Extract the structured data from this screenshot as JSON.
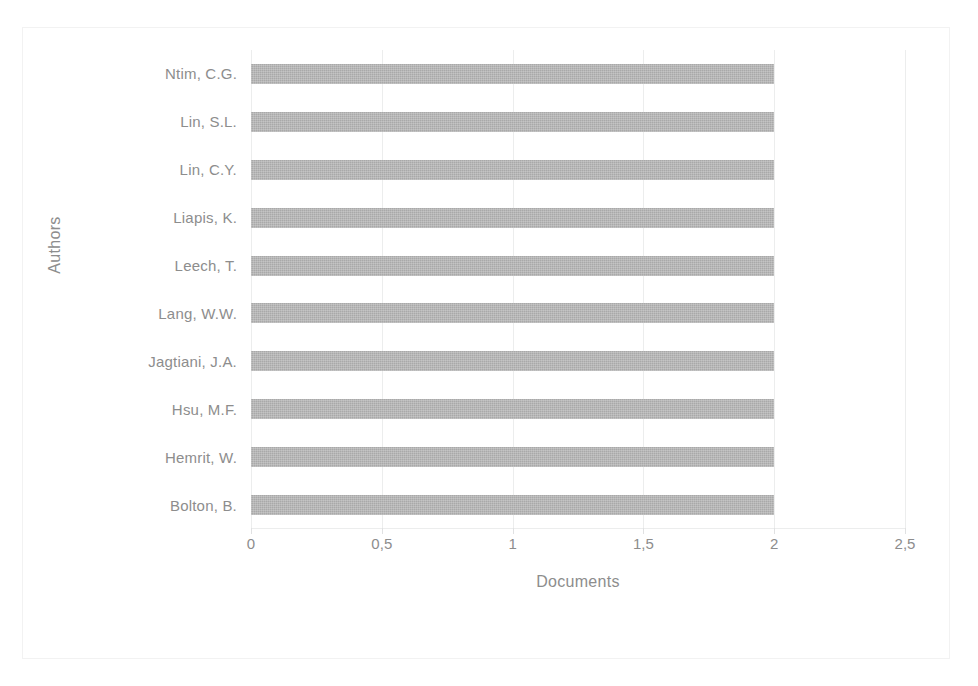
{
  "chart_data": {
    "type": "bar",
    "orientation": "horizontal",
    "title": "",
    "xlabel": "Documents",
    "ylabel": "Authors",
    "categories": [
      "Ntim, C.G.",
      "Lin, S.L.",
      "Lin, C.Y.",
      "Liapis, K.",
      "Leech, T.",
      "Lang, W.W.",
      "Jagtiani, J.A.",
      "Hsu, M.F.",
      "Hemrit, W.",
      "Bolton, B."
    ],
    "values": [
      2,
      2,
      2,
      2,
      2,
      2,
      2,
      2,
      2,
      2
    ],
    "xlim": [
      0,
      2.5
    ],
    "xticks": [
      0,
      0.5,
      1,
      1.5,
      2,
      2.5
    ],
    "xtick_labels": [
      "0",
      "0,5",
      "1",
      "1,5",
      "2",
      "2,5"
    ],
    "grid": true,
    "grid_axis": "x",
    "legend": false,
    "bar_color": "#a9a9a9",
    "gridline_color": "#eceded",
    "text_color": "#8d8d8d",
    "background_color": "#ffffff",
    "border_color": "#f2f2f2"
  }
}
